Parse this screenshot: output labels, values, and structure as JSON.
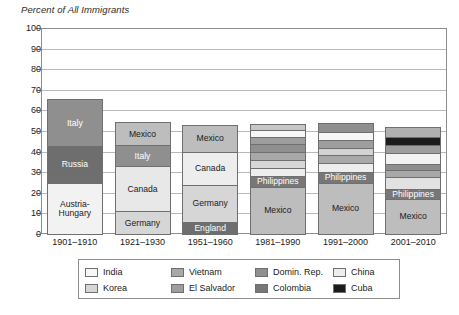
{
  "chart_data": {
    "type": "bar",
    "title": "Percent of All Immigrants",
    "subtitle": "",
    "xlabel": "",
    "ylabel": "",
    "ylim": [
      0,
      100
    ],
    "ytick_step": 10,
    "yticks": [
      "0",
      "10",
      "20",
      "30",
      "40",
      "50",
      "60",
      "70",
      "80",
      "90",
      "100"
    ],
    "grid": true,
    "stacked": true,
    "legend_position": "bottom",
    "categories": [
      "1901–1910",
      "1921–1930",
      "1951–1960",
      "1981–1990",
      "1991–2000",
      "2001–2010"
    ],
    "bars": [
      {
        "category": "1901–1910",
        "total": 65.5,
        "segments": [
          {
            "name": "Austria-\nHungary",
            "value": 25.0,
            "color": "#f2f2f2",
            "text_color": "#1a1a1a",
            "show_label": true
          },
          {
            "name": "Russia",
            "value": 17.5,
            "color": "#6e6e6e",
            "text_color": "#ffffff",
            "show_label": true
          },
          {
            "name": "Italy",
            "value": 23.0,
            "color": "#8f8f8f",
            "text_color": "#ffffff",
            "show_label": true
          }
        ]
      },
      {
        "category": "1921–1930",
        "total": 54.5,
        "segments": [
          {
            "name": "Germany",
            "value": 11.0,
            "color": "#d6d6d6",
            "text_color": "#1a1a1a",
            "show_label": true
          },
          {
            "name": "Canada",
            "value": 22.0,
            "color": "#e8e8e8",
            "text_color": "#1a1a1a",
            "show_label": true
          },
          {
            "name": "Italy",
            "value": 10.0,
            "color": "#8f8f8f",
            "text_color": "#ffffff",
            "show_label": true
          },
          {
            "name": "Mexico",
            "value": 11.5,
            "color": "#bdbdbd",
            "text_color": "#1a1a1a",
            "show_label": true
          }
        ]
      },
      {
        "category": "1951–1960",
        "total": 53.0,
        "segments": [
          {
            "name": "England",
            "value": 6.0,
            "color": "#6e6e6e",
            "text_color": "#ffffff",
            "show_label": true
          },
          {
            "name": "Germany",
            "value": 18.0,
            "color": "#d6d6d6",
            "text_color": "#1a1a1a",
            "show_label": true
          },
          {
            "name": "Canada",
            "value": 16.0,
            "color": "#ededed",
            "text_color": "#1a1a1a",
            "show_label": true
          },
          {
            "name": "Mexico",
            "value": 13.0,
            "color": "#bdbdbd",
            "text_color": "#1a1a1a",
            "show_label": true
          }
        ]
      },
      {
        "category": "1981–1990",
        "total": 53.5,
        "segments": [
          {
            "name": "Mexico",
            "value": 23.0,
            "color": "#bdbdbd",
            "text_color": "#1a1a1a",
            "show_label": true
          },
          {
            "name": "Philippines",
            "value": 5.0,
            "color": "#777777",
            "text_color": "#ffffff",
            "show_label": true
          },
          {
            "name": "China",
            "value": 4.0,
            "color": "#ededed",
            "text_color": "#1a1a1a",
            "show_label": false
          },
          {
            "name": "Korea",
            "value": 4.0,
            "color": "#d6d6d6",
            "text_color": "#1a1a1a",
            "show_label": false
          },
          {
            "name": "Vietnam",
            "value": 4.0,
            "color": "#a8a8a8",
            "text_color": "#1a1a1a",
            "show_label": false
          },
          {
            "name": "Domin. Rep.",
            "value": 3.5,
            "color": "#8f8f8f",
            "text_color": "#1a1a1a",
            "show_label": false
          },
          {
            "name": "El Salvador",
            "value": 3.5,
            "color": "#9e9e9e",
            "text_color": "#1a1a1a",
            "show_label": false
          },
          {
            "name": "India",
            "value": 3.5,
            "color": "#f7f7f7",
            "text_color": "#1a1a1a",
            "show_label": false
          },
          {
            "name": "Colombia",
            "value": 3.0,
            "color": "#c7c7c7",
            "text_color": "#1a1a1a",
            "show_label": false
          }
        ]
      },
      {
        "category": "1991–2000",
        "total": 54.0,
        "segments": [
          {
            "name": "Mexico",
            "value": 25.0,
            "color": "#bdbdbd",
            "text_color": "#1a1a1a",
            "show_label": true
          },
          {
            "name": "Philippines",
            "value": 5.0,
            "color": "#777777",
            "text_color": "#ffffff",
            "show_label": true
          },
          {
            "name": "China",
            "value": 4.5,
            "color": "#ededed",
            "text_color": "#1a1a1a",
            "show_label": false
          },
          {
            "name": "Vietnam",
            "value": 4.0,
            "color": "#a8a8a8",
            "text_color": "#1a1a1a",
            "show_label": false
          },
          {
            "name": "Domin. Rep.",
            "value": 3.5,
            "color": "#d2d2d2",
            "text_color": "#1a1a1a",
            "show_label": false
          },
          {
            "name": "El Salvador",
            "value": 3.5,
            "color": "#9e9e9e",
            "text_color": "#1a1a1a",
            "show_label": false
          },
          {
            "name": "India",
            "value": 4.0,
            "color": "#f7f7f7",
            "text_color": "#1a1a1a",
            "show_label": false
          },
          {
            "name": "Korea",
            "value": 4.5,
            "color": "#8f8f8f",
            "text_color": "#1a1a1a",
            "show_label": false
          }
        ]
      },
      {
        "category": "2001–2010",
        "total": 52.0,
        "segments": [
          {
            "name": "Mexico",
            "value": 17.0,
            "color": "#bdbdbd",
            "text_color": "#1a1a1a",
            "show_label": true
          },
          {
            "name": "Philippines",
            "value": 5.0,
            "color": "#777777",
            "text_color": "#ffffff",
            "show_label": true
          },
          {
            "name": "China",
            "value": 5.5,
            "color": "#e2e2e2",
            "text_color": "#1a1a1a",
            "show_label": false
          },
          {
            "name": "Domin. Rep.",
            "value": 3.5,
            "color": "#a8a8a8",
            "text_color": "#1a1a1a",
            "show_label": false
          },
          {
            "name": "Vietnam",
            "value": 3.0,
            "color": "#8f8f8f",
            "text_color": "#1a1a1a",
            "show_label": false
          },
          {
            "name": "India",
            "value": 5.5,
            "color": "#f2f2f2",
            "text_color": "#1a1a1a",
            "show_label": false
          },
          {
            "name": "El Salvador",
            "value": 3.5,
            "color": "#9e9e9e",
            "text_color": "#1a1a1a",
            "show_label": false
          },
          {
            "name": "Cuba",
            "value": 4.0,
            "color": "#1c1c1c",
            "text_color": "#ffffff",
            "show_label": false
          },
          {
            "name": "Korea",
            "value": 5.0,
            "color": "#b0b0b0",
            "text_color": "#1a1a1a",
            "show_label": false
          }
        ]
      }
    ],
    "legend": [
      {
        "label": "India",
        "color": "#f7f7f7"
      },
      {
        "label": "Korea",
        "color": "#d6d6d6"
      },
      {
        "label": "Vietnam",
        "color": "#a8a8a8"
      },
      {
        "label": "El Salvador",
        "color": "#9e9e9e"
      },
      {
        "label": "Domin. Rep.",
        "color": "#8f8f8f"
      },
      {
        "label": "Colombia",
        "color": "#777777"
      },
      {
        "label": "China",
        "color": "#ededed"
      },
      {
        "label": "Cuba",
        "color": "#1c1c1c"
      }
    ]
  }
}
